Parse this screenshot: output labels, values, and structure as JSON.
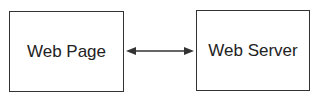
{
  "diagram": {
    "nodes": [
      {
        "id": "web-page",
        "label": "Web Page"
      },
      {
        "id": "web-server",
        "label": "Web Server"
      }
    ],
    "edges": [
      {
        "from": "web-page",
        "to": "web-server",
        "direction": "bidirectional"
      }
    ],
    "colors": {
      "stroke": "#333333",
      "text": "#222222",
      "background": "#ffffff"
    }
  }
}
